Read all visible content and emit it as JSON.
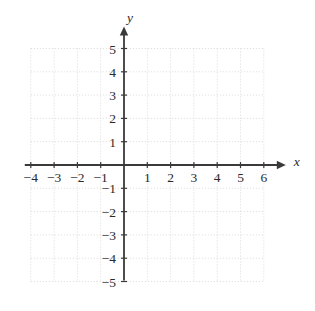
{
  "figure": {
    "type": "coordinate-plane",
    "background_color": "#ffffff",
    "width": 315,
    "height": 311
  },
  "chart_data": {
    "type": "scatter",
    "title": "",
    "xlabel": "x",
    "ylabel": "y",
    "xlim": [
      -4,
      6
    ],
    "ylim": [
      -5,
      5
    ],
    "grid": true,
    "grid_style": "dotted",
    "grid_color": "#d9d9d9",
    "axis_color": "#3a3a3a",
    "legend": "none",
    "series": [
      {
        "name": "empty",
        "x": [],
        "y": []
      }
    ],
    "x_ticks": [
      -4,
      -3,
      -2,
      -1,
      1,
      2,
      3,
      4,
      5,
      6
    ],
    "y_ticks": [
      -5,
      -4,
      -3,
      -2,
      -1,
      1,
      2,
      3,
      4,
      5
    ],
    "x_tick_labels": [
      "−4",
      "−3",
      "−2",
      "−1",
      "1",
      "2",
      "3",
      "4",
      "5",
      "6"
    ],
    "y_tick_labels": [
      "−5",
      "−4",
      "−3",
      "−2",
      "−1",
      "1",
      "2",
      "3",
      "4",
      "5"
    ],
    "annotations": []
  },
  "axes": {
    "x_axis_label": "x",
    "y_axis_label": "y",
    "x_arrow": "right",
    "y_arrow": "up"
  },
  "geometry": {
    "origin_x": 124,
    "origin_y": 165,
    "unit_px": 23.3
  }
}
